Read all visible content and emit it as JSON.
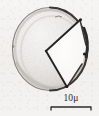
{
  "figure": {
    "kind": "scientific-illustration",
    "background_color": "#f3f2f0",
    "ink_color": "#2b2b2b",
    "body_fill_color": "#efedea",
    "body_shade_color": "#d8d4cf"
  },
  "specimen": {
    "outline_name": "cell-outline",
    "center_x": 50,
    "center_y": 49,
    "radius_x": 38,
    "radius_y": 42,
    "wedge_apex_x": 46,
    "wedge_apex_y": 51,
    "wedge_upper_x": 80,
    "wedge_upper_y": 20,
    "wedge_lower_x": 67,
    "wedge_lower_y": 87,
    "rim_thick_side": "right"
  },
  "scalebar": {
    "label": "10μ",
    "value": 10,
    "unit": "μ",
    "bar_length_px": 42,
    "tick_count": 2
  }
}
